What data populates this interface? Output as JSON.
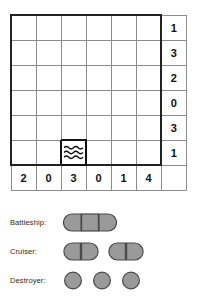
{
  "puzzle": {
    "type": "battleship-solitaire",
    "grid_size": 6,
    "row_clues": [
      1,
      3,
      2,
      0,
      3,
      1
    ],
    "col_clues": [
      2,
      0,
      3,
      0,
      1,
      4
    ],
    "cells": [
      [
        "",
        "",
        "",
        "",
        "",
        ""
      ],
      [
        "",
        "",
        "",
        "",
        "",
        ""
      ],
      [
        "",
        "",
        "",
        "",
        "",
        ""
      ],
      [
        "",
        "",
        "",
        "",
        "",
        ""
      ],
      [
        "",
        "",
        "",
        "",
        "",
        ""
      ],
      [
        "",
        "",
        "water",
        "",
        "",
        ""
      ]
    ],
    "given_marks": [
      {
        "row": 5,
        "col": 2,
        "mark": "water"
      }
    ]
  },
  "legend": {
    "rows": [
      {
        "label": "Battleship:",
        "ship": "battleship",
        "length": 3,
        "count": 1
      },
      {
        "label": "Cruiser:",
        "ship": "cruiser",
        "length": 2,
        "count": 2
      },
      {
        "label": "Destroyer:",
        "ship": "destroyer",
        "length": 1,
        "count": 3
      }
    ]
  },
  "colors": {
    "ship_fill": "#9a9a9a",
    "ship_stroke": "#4a4a4a",
    "grid_line": "#8d8d8d",
    "board_outline": "#222222",
    "text": "#111111",
    "background": "#ffffff"
  }
}
